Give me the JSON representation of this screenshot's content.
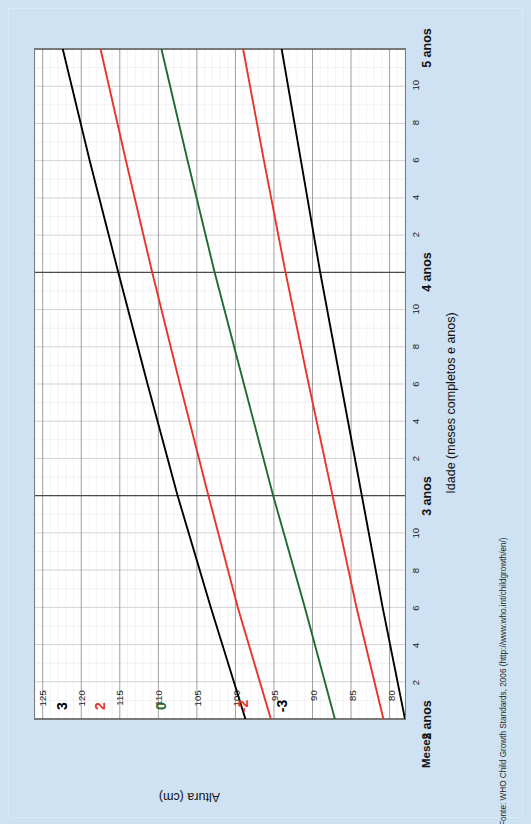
{
  "page": {
    "background_color": "#cfe2f3",
    "plot_background_color": "#ffffff"
  },
  "source_note": "Fonte: WHO Child Growth Standards, 2006 (http://www.who.int/childgrowth/en/)",
  "chart_data": {
    "type": "line",
    "title": "",
    "xlabel": "Idade (meses completos e anos)",
    "ylabel": "Altura (cm)",
    "x_unit_label": "Meses",
    "xlim": [
      24,
      60
    ],
    "ylim": [
      78,
      126
    ],
    "ytick_labels": [
      "125",
      "120",
      "115",
      "110",
      "105",
      "100",
      "95",
      "90",
      "85",
      "80"
    ],
    "ytick_values": [
      125,
      120,
      115,
      110,
      105,
      100,
      95,
      90,
      85,
      80
    ],
    "xtick_month_labels": [
      "2",
      "4",
      "6",
      "8",
      "10"
    ],
    "xtick_year_labels": [
      "2 anos",
      "3 anos",
      "4 anos",
      "5 anos"
    ],
    "xtick_year_values": [
      24,
      36,
      48,
      60
    ],
    "grid": true,
    "grid_minor": true,
    "legend": "curve-end-labels",
    "series": [
      {
        "name": "3",
        "label": "3",
        "color": "#000000",
        "x": [
          24,
          30,
          36,
          42,
          48,
          54,
          60
        ],
        "values": [
          98.7,
          103.2,
          107.5,
          111.4,
          115.2,
          118.9,
          122.4
        ]
      },
      {
        "name": "2",
        "label": "2",
        "color": "#e8342a",
        "x": [
          24,
          30,
          36,
          42,
          48,
          54,
          60
        ],
        "values": [
          95.4,
          99.7,
          103.5,
          107.2,
          110.8,
          114.2,
          117.5
        ]
      },
      {
        "name": "0",
        "label": "0",
        "color": "#1f6b2e",
        "x": [
          24,
          30,
          36,
          42,
          48,
          54,
          60
        ],
        "values": [
          87.1,
          91.0,
          95.1,
          98.9,
          102.7,
          106.2,
          109.6
        ]
      },
      {
        "name": "-2",
        "label": "-2",
        "color": "#e8342a",
        "x": [
          24,
          30,
          36,
          42,
          48,
          54,
          60
        ],
        "values": [
          80.8,
          84.3,
          87.4,
          90.5,
          93.5,
          96.3,
          99.0
        ]
      },
      {
        "name": "-3",
        "label": "-3",
        "color": "#000000",
        "x": [
          24,
          30,
          36,
          42,
          48,
          54,
          60
        ],
        "values": [
          78.0,
          80.9,
          83.6,
          86.3,
          89.0,
          91.5,
          94.0
        ]
      }
    ]
  }
}
